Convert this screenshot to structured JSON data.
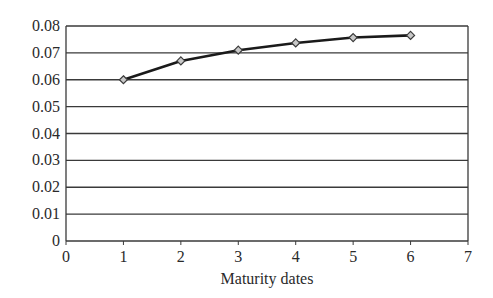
{
  "chart_data": {
    "type": "line",
    "title": "",
    "xlabel": "Maturity dates",
    "ylabel": "",
    "xlim": [
      0,
      7
    ],
    "ylim": [
      0,
      0.08
    ],
    "x_ticks": [
      "0",
      "1",
      "2",
      "3",
      "4",
      "5",
      "6",
      "7"
    ],
    "y_ticks": [
      "0",
      "0.01",
      "0.02",
      "0.03",
      "0.04",
      "0.05",
      "0.06",
      "0.07",
      "0.08"
    ],
    "grid": "horizontal",
    "legend": "none",
    "series": [
      {
        "name": "Yield curve",
        "marker": "diamond",
        "x": [
          1,
          2,
          3,
          4,
          5,
          6
        ],
        "values": [
          0.06,
          0.067,
          0.071,
          0.0737,
          0.0757,
          0.0765
        ]
      }
    ],
    "colors": {
      "line": "#1a1a1a",
      "marker_fill": "#c8c8c8",
      "grid": "#3a3a3a"
    }
  }
}
